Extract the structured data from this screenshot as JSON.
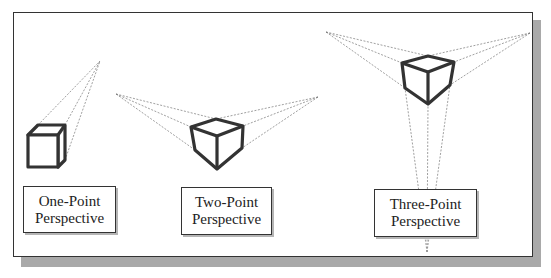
{
  "diagram": {
    "panels": [
      {
        "id": "one-point",
        "label_line1": "One-Point",
        "label_line2": "Perspective",
        "vanishing_points": [
          [
            100,
            61
          ]
        ]
      },
      {
        "id": "two-point",
        "label_line1": "Two-Point",
        "label_line2": "Perspective",
        "vanishing_points": [
          [
            116,
            94
          ],
          [
            318,
            97
          ]
        ]
      },
      {
        "id": "three-point",
        "label_line1": "Three-Point",
        "label_line2": "Perspective",
        "vanishing_points": [
          [
            326,
            32
          ],
          [
            530,
            33
          ],
          [
            427,
            252
          ]
        ]
      }
    ],
    "colors": {
      "cube_stroke": "#333333",
      "construction_line": "#777777",
      "frame_border": "#333333",
      "shadow": "#a9a9a9"
    }
  }
}
